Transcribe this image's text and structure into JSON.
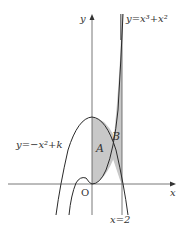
{
  "diagram": {
    "type": "function-graph",
    "colors": {
      "curve": "#2a2a2a",
      "axis": "#555555",
      "shade": "#c8c8c8",
      "background": "#ffffff"
    },
    "axes": {
      "x_label": "x",
      "y_label": "y",
      "origin_label": "O"
    },
    "curves": [
      {
        "id": "cubic",
        "label": "y=x³+x²"
      },
      {
        "id": "parabola",
        "label": "y=−x²+k"
      }
    ],
    "vertical_line": {
      "label": "x=2"
    },
    "regions": [
      {
        "id": "A",
        "label": "A"
      },
      {
        "id": "B",
        "label": "B"
      }
    ]
  }
}
